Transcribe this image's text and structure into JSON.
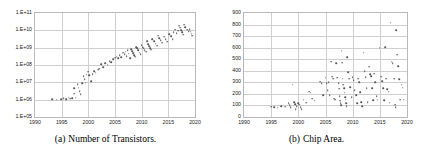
{
  "figure": {
    "panels": [
      {
        "id": "panel-a",
        "caption_tag": "(a)",
        "caption_text": "Number of Transistors.",
        "chart_data": {
          "type": "scatter",
          "title": "Number of Transistors",
          "xlabel": "",
          "ylabel": "",
          "xlim": [
            1990,
            2020
          ],
          "ylim": [
            100000,
            100000000000
          ],
          "yscale": "log",
          "grid": true,
          "legend": "none",
          "xticks": [
            1990,
            1995,
            2000,
            2005,
            2010,
            2015,
            2020
          ],
          "yticks": [
            "1.E+05",
            "1.E+06",
            "1.E+07",
            "1.E+08",
            "1.E+09",
            "1.E+10",
            "1.E+11"
          ],
          "ytick_values": [
            100000,
            1000000,
            10000000,
            100000000,
            1000000000,
            10000000000,
            100000000000
          ],
          "points": [
            [
              1993.2,
              1100000
            ],
            [
              1994.1,
              1000000
            ],
            [
              1994.9,
              1050000
            ],
            [
              1995.4,
              1200000
            ],
            [
              1995.9,
              1100000
            ],
            [
              1996.3,
              1300000
            ],
            [
              1996.6,
              1150000
            ],
            [
              1997.0,
              1200000
            ],
            [
              1997.3,
              4500000
            ],
            [
              1997.4,
              2200000
            ],
            [
              1997.6,
              1300000
            ],
            [
              1998.0,
              7500000
            ],
            [
              1998.2,
              5000000
            ],
            [
              1998.4,
              3000000
            ],
            [
              1998.6,
              2000000
            ],
            [
              1998.9,
              9000000
            ],
            [
              1999.1,
              22000000
            ],
            [
              1999.3,
              15000000
            ],
            [
              1999.5,
              9500000
            ],
            [
              1999.7,
              28000000
            ],
            [
              2000.0,
              42000000
            ],
            [
              2000.2,
              25000000
            ],
            [
              2000.5,
              12000000
            ],
            [
              2000.8,
              30000000
            ],
            [
              2001.1,
              45000000
            ],
            [
              2001.4,
              35000000
            ],
            [
              2001.8,
              55000000
            ],
            [
              2002.0,
              60000000
            ],
            [
              2002.4,
              110000000
            ],
            [
              2002.8,
              75000000
            ],
            [
              2003.2,
              130000000
            ],
            [
              2003.6,
              105000000
            ],
            [
              2004.0,
              170000000
            ],
            [
              2004.3,
              140000000
            ],
            [
              2004.7,
              220000000
            ],
            [
              2005.0,
              260000000
            ],
            [
              2005.3,
              300000000
            ],
            [
              2005.6,
              240000000
            ],
            [
              2005.9,
              380000000
            ],
            [
              2006.2,
              290000000
            ],
            [
              2006.5,
              500000000
            ],
            [
              2006.8,
              410000000
            ],
            [
              2007.0,
              580000000
            ],
            [
              2007.2,
              330000000
            ],
            [
              2007.4,
              700000000
            ],
            [
              2007.6,
              450000000
            ],
            [
              2007.8,
              250000000
            ],
            [
              2008.0,
              820000000
            ],
            [
              2008.2,
              620000000
            ],
            [
              2008.4,
              480000000
            ],
            [
              2008.6,
              380000000
            ],
            [
              2008.8,
              300000000
            ],
            [
              2009.0,
              1100000000
            ],
            [
              2009.2,
              900000000
            ],
            [
              2009.4,
              700000000
            ],
            [
              2009.6,
              520000000
            ],
            [
              2009.8,
              410000000
            ],
            [
              2010.0,
              1400000000
            ],
            [
              2010.2,
              1100000000
            ],
            [
              2010.4,
              900000000
            ],
            [
              2010.6,
              720000000
            ],
            [
              2010.8,
              600000000
            ],
            [
              2011.0,
              2300000000
            ],
            [
              2011.2,
              1600000000
            ],
            [
              2011.4,
              1200000000
            ],
            [
              2011.6,
              950000000
            ],
            [
              2011.8,
              780000000
            ],
            [
              2012.0,
              3100000000
            ],
            [
              2012.3,
              2400000000
            ],
            [
              2012.6,
              1700000000
            ],
            [
              2012.9,
              1300000000
            ],
            [
              2013.1,
              5000000000
            ],
            [
              2013.3,
              3500000000
            ],
            [
              2013.6,
              2600000000
            ],
            [
              2013.9,
              1900000000
            ],
            [
              2014.2,
              4200000000
            ],
            [
              2014.5,
              3000000000
            ],
            [
              2014.8,
              2200000000
            ],
            [
              2015.2,
              6000000000
            ],
            [
              2015.5,
              4500000000
            ],
            [
              2015.8,
              3200000000
            ],
            [
              2016.0,
              8000000000
            ],
            [
              2016.3,
              11000000000
            ],
            [
              2016.6,
              7000000000
            ],
            [
              2016.9,
              9500000000
            ],
            [
              2017.0,
              19000000000
            ],
            [
              2017.2,
              14000000000
            ],
            [
              2017.4,
              10000000000
            ],
            [
              2017.6,
              7500000000
            ],
            [
              2017.8,
              5500000000
            ],
            [
              2018.0,
              21000000000
            ],
            [
              2018.2,
              15000000000
            ],
            [
              2018.5,
              11000000000
            ],
            [
              2018.8,
              9000000000
            ],
            [
              2019.0,
              12000000000
            ],
            [
              2019.2,
              8500000000
            ],
            [
              2019.4,
              6500000000
            ],
            [
              2019.5,
              5000000000
            ]
          ]
        }
      },
      {
        "id": "panel-b",
        "caption_tag": "(b)",
        "caption_text": "Chip Area.",
        "chart_data": {
          "type": "scatter",
          "title": "Chip Area",
          "xlabel": "",
          "ylabel": "",
          "xlim": [
            1990,
            2020
          ],
          "ylim": [
            0,
            900
          ],
          "yscale": "linear",
          "grid": true,
          "legend": "none",
          "xticks": [
            1990,
            1995,
            2000,
            2005,
            2010,
            2015,
            2020
          ],
          "yticks": [
            0,
            100,
            200,
            300,
            400,
            500,
            600,
            700,
            800,
            900
          ],
          "points": [
            [
              1995.0,
              90
            ],
            [
              1995.6,
              85
            ],
            [
              1996.2,
              80
            ],
            [
              1996.9,
              95
            ],
            [
              1997.6,
              90
            ],
            [
              1998.2,
              120
            ],
            [
              1998.4,
              100
            ],
            [
              1998.6,
              85
            ],
            [
              1999.0,
              280
            ],
            [
              1999.2,
              130
            ],
            [
              1999.4,
              110
            ],
            [
              1999.5,
              70
            ],
            [
              1999.7,
              95
            ],
            [
              2000.0,
              120
            ],
            [
              2000.2,
              105
            ],
            [
              2000.4,
              85
            ],
            [
              2000.6,
              65
            ],
            [
              2001.0,
              150
            ],
            [
              2001.4,
              125
            ],
            [
              2002.0,
              220
            ],
            [
              2002.3,
              210
            ],
            [
              2002.6,
              160
            ],
            [
              2003.0,
              140
            ],
            [
              2004.0,
              305
            ],
            [
              2004.3,
              295
            ],
            [
              2004.6,
              190
            ],
            [
              2005.0,
              340
            ],
            [
              2005.2,
              290
            ],
            [
              2005.4,
              230
            ],
            [
              2005.6,
              300
            ],
            [
              2005.8,
              190
            ],
            [
              2006.0,
              480
            ],
            [
              2006.2,
              350
            ],
            [
              2006.4,
              330
            ],
            [
              2006.6,
              160
            ],
            [
              2006.8,
              150
            ],
            [
              2007.0,
              465
            ],
            [
              2007.2,
              340
            ],
            [
              2007.4,
              290
            ],
            [
              2007.5,
              245
            ],
            [
              2007.6,
              180
            ],
            [
              2007.7,
              140
            ],
            [
              2007.8,
              120
            ],
            [
              2007.9,
              100
            ],
            [
              2008.0,
              575
            ],
            [
              2008.1,
              470
            ],
            [
              2008.2,
              330
            ],
            [
              2008.3,
              280
            ],
            [
              2008.4,
              250
            ],
            [
              2008.5,
              210
            ],
            [
              2008.6,
              170
            ],
            [
              2008.7,
              150
            ],
            [
              2008.8,
              120
            ],
            [
              2008.9,
              95
            ],
            [
              2009.0,
              520
            ],
            [
              2009.2,
              390
            ],
            [
              2009.4,
              330
            ],
            [
              2009.6,
              260
            ],
            [
              2009.8,
              170
            ],
            [
              2010.0,
              345
            ],
            [
              2010.2,
              320
            ],
            [
              2010.4,
              230
            ],
            [
              2010.6,
              190
            ],
            [
              2010.8,
              120
            ],
            [
              2011.0,
              330
            ],
            [
              2011.2,
              300
            ],
            [
              2011.4,
              215
            ],
            [
              2011.6,
              130
            ],
            [
              2011.8,
              95
            ],
            [
              2012.0,
              555
            ],
            [
              2012.2,
              395
            ],
            [
              2012.4,
              345
            ],
            [
              2012.6,
              250
            ],
            [
              2012.8,
              130
            ],
            [
              2013.0,
              435
            ],
            [
              2013.2,
              370
            ],
            [
              2013.4,
              355
            ],
            [
              2013.6,
              250
            ],
            [
              2013.8,
              145
            ],
            [
              2014.0,
              375
            ],
            [
              2014.2,
              300
            ],
            [
              2014.4,
              180
            ],
            [
              2014.6,
              150
            ],
            [
              2015.0,
              600
            ],
            [
              2015.2,
              350
            ],
            [
              2015.4,
              310
            ],
            [
              2015.6,
              250
            ],
            [
              2015.8,
              145
            ],
            [
              2016.0,
              605
            ],
            [
              2016.2,
              330
            ],
            [
              2016.4,
              240
            ],
            [
              2016.6,
              220
            ],
            [
              2016.8,
              125
            ],
            [
              2017.0,
              815
            ],
            [
              2017.2,
              480
            ],
            [
              2017.4,
              465
            ],
            [
              2017.6,
              330
            ],
            [
              2017.8,
              105
            ],
            [
              2017.9,
              85
            ],
            [
              2018.0,
              750
            ],
            [
              2018.2,
              540
            ],
            [
              2018.4,
              440
            ],
            [
              2018.6,
              325
            ],
            [
              2018.8,
              150
            ],
            [
              2019.0,
              280
            ],
            [
              2019.2,
              255
            ],
            [
              2019.4,
              150
            ]
          ]
        }
      }
    ]
  }
}
